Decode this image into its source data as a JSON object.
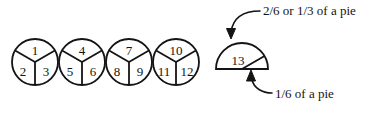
{
  "figure": {
    "background_color": "#ffffff",
    "stroke_color": "#141414",
    "whole_pies": [
      {
        "id": "pie-1",
        "cx": 35,
        "cy": 62,
        "r": 23,
        "slices": [
          "1",
          "2",
          "3"
        ]
      },
      {
        "id": "pie-2",
        "cx": 82,
        "cy": 62,
        "r": 23,
        "slices": [
          "4",
          "5",
          "6"
        ]
      },
      {
        "id": "pie-3",
        "cx": 129,
        "cy": 62,
        "r": 23,
        "slices": [
          "7",
          "8",
          "9"
        ]
      },
      {
        "id": "pie-4",
        "cx": 176,
        "cy": 62,
        "r": 23,
        "slices": [
          "10",
          "11",
          "12"
        ]
      }
    ],
    "partial_pie": {
      "id": "pie-5",
      "cx": 242,
      "cy": 69,
      "r": 26,
      "filled_slice_label": "13",
      "empty_slice_label": ""
    },
    "annotations": [
      {
        "id": "annotation-top",
        "text": "2/6 or 1/3 of a pie",
        "points_to": "partial-pie-top-wedge"
      },
      {
        "id": "annotation-bottom",
        "text": "1/6 of a pie",
        "points_to": "partial-pie-small-wedge"
      }
    ]
  }
}
